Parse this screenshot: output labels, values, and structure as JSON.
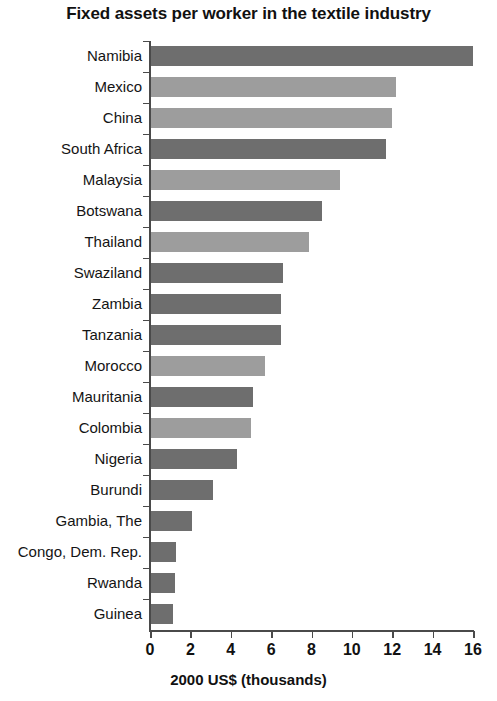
{
  "chart_data": {
    "type": "bar",
    "orientation": "horizontal",
    "title": "Fixed assets per worker in the textile industry",
    "xlabel": "2000 US$ (thousands)",
    "ylabel": "",
    "xlim": [
      0,
      16
    ],
    "xticks": [
      0,
      2,
      4,
      6,
      8,
      10,
      12,
      14,
      16
    ],
    "xtick_labels": [
      "0",
      "2",
      "4",
      "6",
      "8",
      "10",
      "12",
      "14",
      "16"
    ],
    "grid": false,
    "legend": false,
    "categories": [
      "Namibia",
      "Mexico",
      "China",
      "South Africa",
      "Malaysia",
      "Botswana",
      "Thailand",
      "Swaziland",
      "Zambia",
      "Tanzania",
      "Morocco",
      "Mauritania",
      "Colombia",
      "Nigeria",
      "Burundi",
      "Gambia, The",
      "Congo, Dem. Rep.",
      "Rwanda",
      "Guinea"
    ],
    "values": [
      16.0,
      12.2,
      12.0,
      11.7,
      9.4,
      8.5,
      7.9,
      6.6,
      6.5,
      6.5,
      5.7,
      5.1,
      5.0,
      4.3,
      3.1,
      2.1,
      1.3,
      1.25,
      1.15
    ],
    "bar_shades": [
      "dark",
      "light",
      "light",
      "dark",
      "light",
      "dark",
      "light",
      "dark",
      "dark",
      "dark",
      "light",
      "dark",
      "light",
      "dark",
      "dark",
      "dark",
      "dark",
      "dark",
      "dark"
    ],
    "colors": {
      "dark": "#6e6e6e",
      "light": "#9d9d9d",
      "axis": "#4a4a4a",
      "text": "#111111",
      "background": "#ffffff"
    }
  }
}
